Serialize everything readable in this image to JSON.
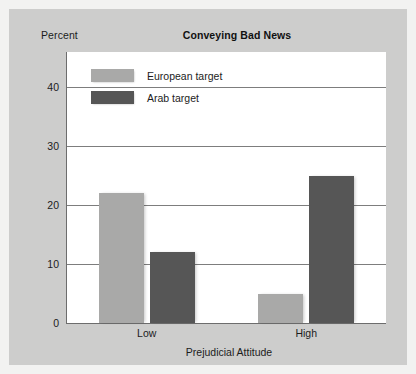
{
  "figure": {
    "percent_axis_label": "Percent",
    "background_color": "#cdcdcc",
    "plot_background_color": "#ffffff"
  },
  "chart_data": {
    "type": "bar",
    "title": "Conveying Bad News",
    "xlabel": "Prejudicial Attitude",
    "ylabel": "Percent",
    "categories": [
      "Low",
      "High"
    ],
    "series": [
      {
        "name": "European target",
        "values": [
          22,
          5
        ],
        "color": "#a9a9a8"
      },
      {
        "name": "Arab target",
        "values": [
          12,
          25
        ],
        "color": "#565656"
      }
    ],
    "ylim": [
      0,
      46
    ],
    "yticks": [
      0,
      10,
      20,
      30,
      40
    ],
    "ytick_labels": [
      "0",
      "10",
      "20",
      "30",
      "40"
    ],
    "grid": true,
    "legend_position": "top-left-inside"
  }
}
